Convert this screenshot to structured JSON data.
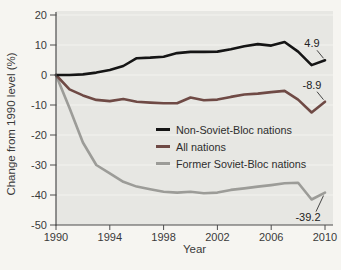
{
  "page": {
    "background": "#f6f5f1"
  },
  "chart_data": {
    "type": "line",
    "title": "",
    "xlabel": "Year",
    "ylabel": "Change from 1990 level (%)",
    "xlim": [
      1990,
      2010
    ],
    "ylim": [
      -50,
      20
    ],
    "x_ticks": [
      1990,
      1994,
      1998,
      2002,
      2006,
      2010
    ],
    "y_ticks": [
      20,
      10,
      0,
      -10,
      -20,
      -30,
      -40,
      -50
    ],
    "grid": true,
    "legend_position": "inside-middle-right",
    "panel_color": "#e7e7e3",
    "grid_color": "#f3f3ef",
    "axis_color": "#4d4d4d",
    "x": [
      1990,
      1991,
      1992,
      1993,
      1994,
      1995,
      1996,
      1997,
      1998,
      1999,
      2000,
      2001,
      2002,
      2003,
      2004,
      2005,
      2006,
      2007,
      2008,
      2009,
      2010
    ],
    "series": [
      {
        "name": "Non-Soviet-Bloc nations",
        "color": "#151515",
        "end_label": "4.9",
        "end_label_side": "above",
        "values": [
          0,
          0,
          0.2,
          0.8,
          1.7,
          3.0,
          5.6,
          5.8,
          6.1,
          7.3,
          7.7,
          7.7,
          7.8,
          8.6,
          9.6,
          10.3,
          9.8,
          11.0,
          7.8,
          3.3,
          4.9
        ]
      },
      {
        "name": "All nations",
        "color": "#6f4a45",
        "end_label": "-8.9",
        "end_label_side": "above",
        "values": [
          0,
          -4.8,
          -6.8,
          -8.3,
          -8.7,
          -8.0,
          -8.9,
          -9.2,
          -9.4,
          -9.4,
          -7.5,
          -8.4,
          -8.2,
          -7.3,
          -6.5,
          -6.2,
          -5.7,
          -5.3,
          -8.2,
          -12.5,
          -8.9
        ]
      },
      {
        "name": "Former Soviet-Bloc nations",
        "color": "#9c9c98",
        "end_label": "-39.2",
        "end_label_side": "below",
        "values": [
          0,
          -11,
          -22.5,
          -30,
          -32.8,
          -35.6,
          -37.2,
          -38.1,
          -38.9,
          -39.2,
          -38.9,
          -39.4,
          -39.2,
          -38.3,
          -37.8,
          -37.2,
          -36.7,
          -36.1,
          -35.9,
          -41.5,
          -39.2
        ]
      }
    ]
  }
}
